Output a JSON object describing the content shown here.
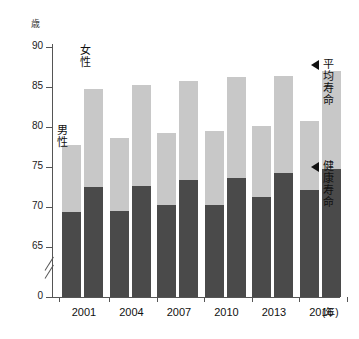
{
  "chart_data": {
    "type": "bar",
    "title": "",
    "subtitle": "",
    "xlabel": "(年)",
    "ylabel": "歳",
    "ylim": [
      65,
      90
    ],
    "axis_break": true,
    "grid": false,
    "legend_position": "in-plot",
    "categories": [
      "2001",
      "2004",
      "2007",
      "2010",
      "2013",
      "2016"
    ],
    "y_ticks": [
      "90",
      "85",
      "80",
      "75",
      "70",
      "65",
      "0"
    ],
    "y_tick_values": [
      90,
      85,
      80,
      75,
      70,
      65,
      0
    ],
    "series": [
      {
        "name": "男性 平均寿命",
        "sex": "男性",
        "measure": "平均寿命",
        "values": [
          77.8,
          78.6,
          79.2,
          79.5,
          80.1,
          80.8
        ]
      },
      {
        "name": "男性 健康寿命",
        "sex": "男性",
        "measure": "健康寿命",
        "values": [
          69.4,
          69.5,
          70.2,
          70.2,
          71.2,
          72.1
        ]
      },
      {
        "name": "女性 平均寿命",
        "sex": "女性",
        "measure": "平均寿命",
        "values": [
          84.7,
          85.3,
          85.8,
          86.2,
          86.4,
          87.0
        ]
      },
      {
        "name": "女性 健康寿命",
        "sex": "女性",
        "measure": "健康寿命",
        "values": [
          72.5,
          72.6,
          73.4,
          73.6,
          74.2,
          74.8
        ]
      }
    ],
    "annotations": [
      {
        "text": "男性",
        "role": "series-label-male"
      },
      {
        "text": "女性",
        "role": "series-label-female"
      },
      {
        "text": "平均寿命",
        "role": "callout-life-expectancy"
      },
      {
        "text": "健康寿命",
        "role": "callout-healthy-life-expectancy"
      }
    ],
    "colors": {
      "life_expectancy": "#c8c8c8",
      "healthy_life_expectancy": "#4a4a4a",
      "axis": "#555555",
      "text": "#111111",
      "background": "#ffffff"
    }
  },
  "labels": {
    "y_unit": "歳",
    "x_unit": "(年)",
    "male": "男性",
    "female": "女性",
    "callout_life": "平均寿命",
    "callout_healthy": "健康寿命"
  }
}
